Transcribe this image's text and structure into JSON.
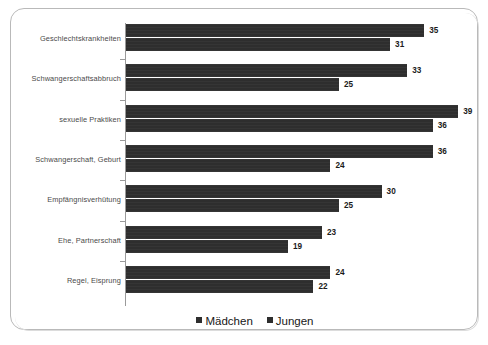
{
  "chart_data": {
    "type": "bar",
    "orientation": "horizontal",
    "title": "",
    "subtitle": "",
    "xlabel": "",
    "ylabel": "",
    "grid": false,
    "legend_position": "bottom",
    "xlim": [
      0,
      42
    ],
    "categories": [
      "Geschlechtskrankheiten",
      "Schwangerschaftsabbruch",
      "sexuelle Praktiken",
      "Schwangerschaft, Geburt",
      "Empfängnisverhütung",
      "Ehe, Partnerschaft",
      "Regel, Eisprung"
    ],
    "series": [
      {
        "name": "Mädchen",
        "color": "#2e2e2e",
        "values": [
          35,
          33,
          39,
          36,
          30,
          23,
          24
        ]
      },
      {
        "name": "Jungen",
        "color": "#2e2e2e",
        "values": [
          31,
          25,
          36,
          24,
          25,
          19,
          22
        ]
      }
    ]
  },
  "legend": {
    "items": [
      {
        "label": "Mädchen"
      },
      {
        "label": "Jungen"
      }
    ]
  },
  "colors": {
    "bar": "#2e2e2e",
    "axis": "#9a9a9a",
    "frame": "#b9b9b9",
    "label_text": "#4a4a4a",
    "value_text": "#1b1b1b",
    "background": "#ffffff"
  }
}
